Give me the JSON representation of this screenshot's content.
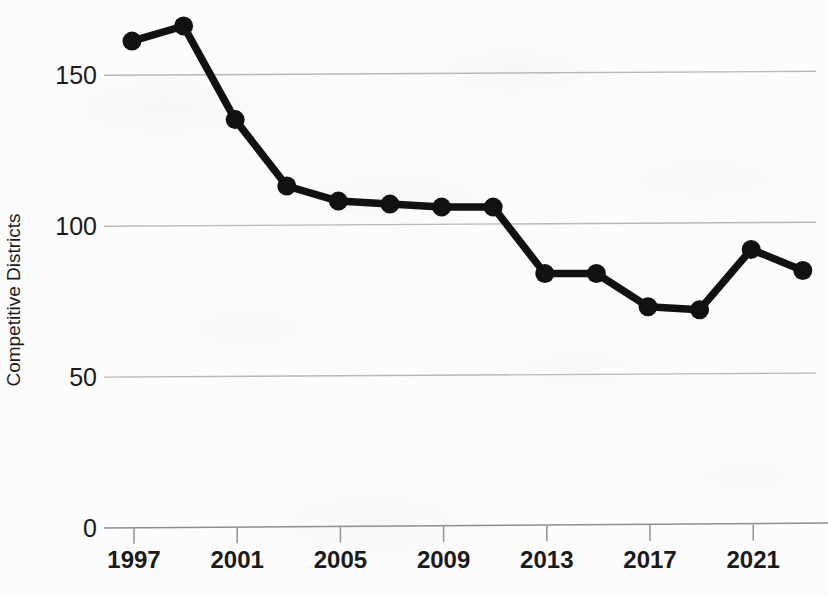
{
  "chart_data": {
    "type": "line",
    "title": "",
    "xlabel": "",
    "ylabel": "Competitive Districts",
    "x": [
      1997,
      1999,
      2001,
      2003,
      2005,
      2007,
      2009,
      2011,
      2013,
      2015,
      2017,
      2019,
      2021,
      2023
    ],
    "values": [
      160,
      165,
      134,
      112,
      107,
      106,
      105,
      105,
      83,
      83,
      72,
      71,
      91,
      84
    ],
    "series": [
      {
        "name": "Competitive Districts",
        "values": [
          160,
          165,
          134,
          112,
          107,
          106,
          105,
          105,
          83,
          83,
          72,
          71,
          91,
          84
        ]
      }
    ],
    "xticks": [
      1997,
      2001,
      2005,
      2009,
      2013,
      2017,
      2021
    ],
    "xtick_labels": [
      "1997",
      "2001",
      "2005",
      "2009",
      "2013",
      "2017",
      "2021"
    ],
    "yticks": [
      0,
      50,
      100,
      150
    ],
    "ytick_labels": [
      "0",
      "50",
      "100",
      "150"
    ],
    "xlim": [
      1996,
      2024
    ],
    "ylim": [
      0,
      173
    ],
    "grid": true,
    "legend": false,
    "marker": "circle",
    "line_color": "#111111",
    "marker_color": "#111111",
    "grid_color": "#b9b9b9",
    "background_color": "#fcfcfc"
  }
}
